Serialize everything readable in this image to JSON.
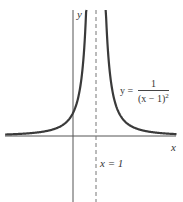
{
  "chart_data": {
    "type": "line",
    "title": "",
    "function": "y = 1/(x-1)^2",
    "xlabel": "x",
    "ylabel": "y",
    "asymptote": {
      "type": "vertical",
      "x": 1,
      "style": "dashed",
      "label": "x = 1"
    },
    "horizontal_asymptote": {
      "y": 0
    },
    "xlim": [
      -3,
      4.5
    ],
    "ylim": [
      -2.9,
      5.5
    ],
    "grid": false,
    "legend": null,
    "annotations": [
      {
        "text": "y = 1/(x − 1)²",
        "position": "right branch, near x≈2.1, y≈1.7"
      },
      {
        "text": "x = 1",
        "position": "below x-axis, right of dashed line"
      }
    ],
    "series": [
      {
        "name": "y = 1/(x-1)^2 (left branch)",
        "x": [
          -3,
          -2,
          -1,
          0,
          0.5,
          0.6
        ],
        "y": [
          0.0625,
          0.111,
          0.25,
          1,
          4,
          6.25
        ]
      },
      {
        "name": "y = 1/(x-1)^2 (right branch)",
        "x": [
          1.45,
          1.5,
          2,
          3,
          4
        ],
        "y": [
          4.94,
          4,
          1,
          0.25,
          0.111
        ]
      }
    ]
  },
  "labels": {
    "y_axis": "y",
    "x_axis": "x",
    "asymptote": "x = 1",
    "equation_lhs": "y =",
    "equation_num": "1",
    "equation_den": "(x − 1)",
    "equation_exp": "2"
  },
  "colors": {
    "curve": "#3a3a3a",
    "axes": "#555555",
    "asymptote": "#777777"
  }
}
